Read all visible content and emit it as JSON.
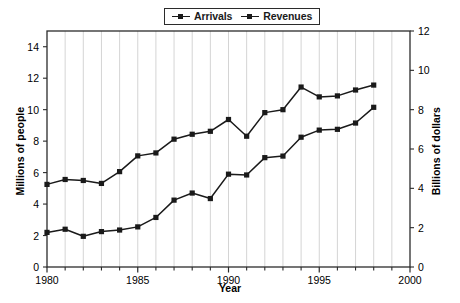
{
  "chart_data": {
    "type": "line",
    "title": "",
    "subtitle": "",
    "xlabel": "Year",
    "ylabel": "Millions of people",
    "ylabel_right": "Billions of dollars",
    "xlim": [
      1980,
      2000
    ],
    "ylim": [
      0,
      15
    ],
    "ylim_right": [
      0,
      12
    ],
    "xticks": [
      1980,
      1985,
      1990,
      1995,
      2000
    ],
    "xticklabels": [
      "1980",
      "1985",
      "1990",
      "1995",
      "2000"
    ],
    "xminorticks": [
      1981,
      1982,
      1983,
      1984,
      1986,
      1987,
      1988,
      1989,
      1991,
      1992,
      1993,
      1994,
      1996,
      1997,
      1998,
      1999
    ],
    "yticks": [
      0,
      2,
      4,
      6,
      8,
      10,
      12,
      14
    ],
    "yticklabels": [
      "0",
      "2",
      "4",
      "6",
      "8",
      "10",
      "12",
      "14"
    ],
    "yticks_right": [
      0,
      2,
      4,
      6,
      8,
      10,
      12
    ],
    "yticklabels_right": [
      "0",
      "2",
      "4",
      "6",
      "8",
      "10",
      "12"
    ],
    "grid": "vertical-yearly",
    "legend_position": "top-center",
    "marker": "square",
    "line_color": "#1a1a1a",
    "x": [
      1980,
      1981,
      1982,
      1983,
      1984,
      1985,
      1986,
      1987,
      1988,
      1989,
      1990,
      1991,
      1992,
      1993,
      1994,
      1995,
      1996,
      1997,
      1998
    ],
    "series": [
      {
        "name": "Arrivals",
        "axis": "left",
        "units": "Millions of people",
        "values": [
          2.2,
          2.4,
          1.95,
          2.25,
          2.35,
          2.55,
          3.15,
          4.25,
          4.7,
          4.35,
          5.9,
          5.85,
          6.95,
          7.05,
          8.25,
          8.7,
          8.75,
          9.15,
          10.15
        ]
      },
      {
        "name": "Revenues",
        "axis": "right",
        "units": "Billions of dollars",
        "values": [
          4.2,
          4.45,
          4.4,
          4.25,
          4.85,
          5.65,
          5.8,
          6.5,
          6.75,
          6.9,
          7.5,
          6.65,
          7.85,
          8.0,
          9.15,
          8.65,
          8.7,
          9.0,
          9.25
        ]
      }
    ]
  },
  "legend": {
    "entries": [
      {
        "label": "Arrivals"
      },
      {
        "label": "Revenues"
      }
    ]
  },
  "axes": {
    "x_title": "Year",
    "y_left_title": "Millions of people",
    "y_right_title": "Billions of dollars"
  }
}
